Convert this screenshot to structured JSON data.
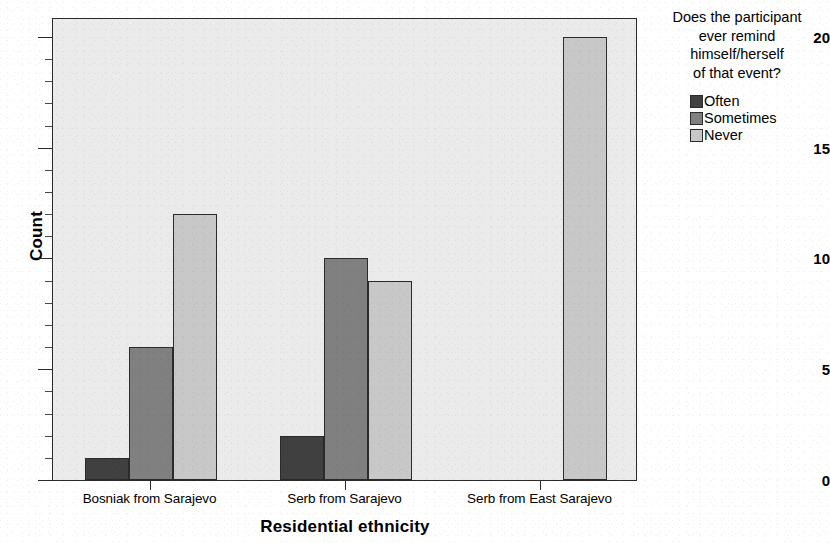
{
  "chart_data": {
    "type": "bar",
    "title": "",
    "subtitle": "",
    "xlabel": "Residential ethnicity",
    "ylabel": "Count",
    "categories": [
      "Bosniak from Sarajevo",
      "Serb from Sarajevo",
      "Serb from East Sarajevo"
    ],
    "series": [
      {
        "name": "Often",
        "values": [
          1,
          2,
          0
        ],
        "color": "#404040"
      },
      {
        "name": "Sometimes",
        "values": [
          6,
          10,
          0
        ],
        "color": "#808080"
      },
      {
        "name": "Never",
        "values": [
          12,
          9,
          20
        ],
        "color": "#c8c8c8"
      }
    ],
    "legend_title": "Does the participant ever remind himself/herself of that event?",
    "legend_position": "right",
    "ylim": [
      0,
      20.9
    ],
    "yticks": [
      0,
      5,
      10,
      15,
      20
    ],
    "ytick_labels": [
      "0",
      "5",
      "10",
      "15",
      "20"
    ],
    "grid": false,
    "plot_background": "#ebebeb",
    "figure_background": "#ffffff",
    "axis_color": "#2b2b2b"
  },
  "axes": {
    "y_title": "Count",
    "x_title": "Residential ethnicity",
    "y_ticks": [
      {
        "value": 20,
        "label": "20"
      },
      {
        "value": 15,
        "label": "15"
      },
      {
        "value": 10,
        "label": "10"
      },
      {
        "value": 5,
        "label": "5"
      },
      {
        "value": 0,
        "label": "0"
      }
    ],
    "x_ticks": [
      {
        "label": "Bosniak from Sarajevo"
      },
      {
        "label": "Serb from Sarajevo"
      },
      {
        "label": "Serb from East Sarajevo"
      }
    ]
  },
  "legend": {
    "title_lines": [
      "Does the participant",
      "ever remind",
      "himself/herself",
      "of that event?"
    ],
    "items": [
      {
        "label": "Often",
        "color": "#404040"
      },
      {
        "label": "Sometimes",
        "color": "#808080"
      },
      {
        "label": "Never",
        "color": "#c8c8c8"
      }
    ]
  }
}
